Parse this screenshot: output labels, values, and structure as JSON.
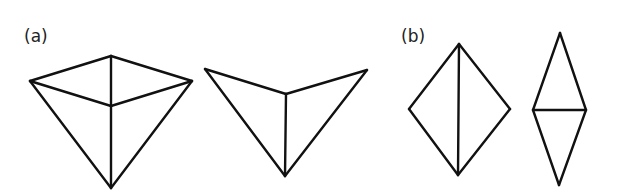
{
  "diagram": {
    "panels": [
      {
        "label": "(a)",
        "label_pos": [
          24,
          28
        ],
        "figures": [
          {
            "name": "pyramid-top-view",
            "vertices": {
              "left": [
                30,
                81
              ],
              "top": [
                111,
                56
              ],
              "right": [
                192,
                81
              ],
              "center": [
                111,
                106
              ],
              "bottom": [
                111,
                188
              ]
            },
            "edges": [
              [
                "left",
                "top"
              ],
              [
                "top",
                "right"
              ],
              [
                "left",
                "center"
              ],
              [
                "center",
                "right"
              ],
              [
                "top",
                "center"
              ],
              [
                "center",
                "bottom"
              ],
              [
                "left",
                "bottom"
              ],
              [
                "right",
                "bottom"
              ]
            ]
          },
          {
            "name": "folded-arrow-shape",
            "vertices": {
              "left": [
                205,
                69
              ],
              "center": [
                286,
                94
              ],
              "right": [
                367,
                70
              ],
              "bottom": [
                285,
                176
              ]
            },
            "edges": [
              [
                "left",
                "center"
              ],
              [
                "center",
                "right"
              ],
              [
                "center",
                "bottom"
              ],
              [
                "left",
                "bottom"
              ],
              [
                "right",
                "bottom"
              ]
            ]
          }
        ]
      },
      {
        "label": "(b)",
        "label_pos": [
          401,
          28
        ],
        "figures": [
          {
            "name": "rhombus-vertical-split",
            "vertices": {
              "top": [
                459,
                44
              ],
              "left": [
                409,
                109
              ],
              "right": [
                510,
                109
              ],
              "bottom": [
                458,
                175
              ]
            },
            "edges": [
              [
                "top",
                "left"
              ],
              [
                "left",
                "bottom"
              ],
              [
                "bottom",
                "right"
              ],
              [
                "right",
                "top"
              ],
              [
                "top",
                "bottom"
              ]
            ]
          },
          {
            "name": "rhombus-horizontal-split",
            "vertices": {
              "top": [
                560,
                33
              ],
              "left": [
                533,
                110
              ],
              "right": [
                586,
                110
              ],
              "bottom": [
                559,
                185
              ]
            },
            "edges": [
              [
                "top",
                "left"
              ],
              [
                "left",
                "bottom"
              ],
              [
                "bottom",
                "right"
              ],
              [
                "right",
                "top"
              ],
              [
                "left",
                "right"
              ]
            ]
          }
        ]
      }
    ],
    "colors": {
      "stroke": "#111111",
      "background": "#ffffff",
      "label": "#222222"
    }
  }
}
